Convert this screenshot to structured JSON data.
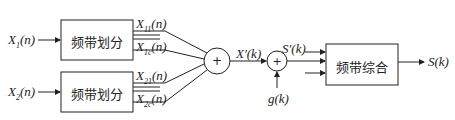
{
  "inputs": [
    {
      "name": "X",
      "sub": "1",
      "arg": "(n)"
    },
    {
      "name": "X",
      "sub": "2",
      "arg": "(n)"
    }
  ],
  "blocks": {
    "split1": "频带划分",
    "split2": "频带划分",
    "synth": "频带综合"
  },
  "band_outputs": [
    {
      "name": "X",
      "sub": "11",
      "arg": "(n)"
    },
    {
      "name": "X",
      "sub": "1c",
      "arg": "(n)"
    },
    {
      "name": "X",
      "sub": "21",
      "arg": "(n)"
    },
    {
      "name": "X",
      "sub": "2c",
      "arg": "(n)"
    }
  ],
  "sum1": {
    "symbol": "+",
    "output": "X′(k)"
  },
  "sum2": {
    "symbol": "+",
    "input": "g(k)",
    "output": "S′(k)"
  },
  "output": "S(k)"
}
